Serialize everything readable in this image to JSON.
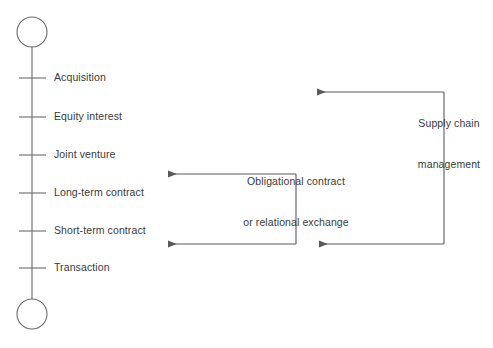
{
  "diagram": {
    "type": "continuum-axis-diagram",
    "colors": {
      "line": "#6b6b6b",
      "text": "#3a3a3a",
      "background": "#ffffff"
    },
    "axis": {
      "name": "governance-continuum-axis",
      "orientation": "vertical",
      "endpoint_top": "circle",
      "endpoint_bottom": "circle",
      "ticks": [
        {
          "label": "Acquisition",
          "y": 78
        },
        {
          "label": "Equity interest",
          "y": 117
        },
        {
          "label": "Joint venture",
          "y": 155
        },
        {
          "label": "Long-term contract",
          "y": 193
        },
        {
          "label": "Short-term contract",
          "y": 231
        },
        {
          "label": "Transaction",
          "y": 268
        }
      ]
    },
    "annotations": [
      {
        "name": "obligational-contract-bracket",
        "line1": "Obligational contract",
        "line2": "or relational exchange",
        "spans_from": "Long-term contract",
        "spans_to": "Short-term contract"
      },
      {
        "name": "supply-chain-management-bracket",
        "line1": "Supply chain",
        "line2": "management",
        "spans_from": "Equity interest",
        "spans_to": "Short-term contract"
      }
    ]
  }
}
